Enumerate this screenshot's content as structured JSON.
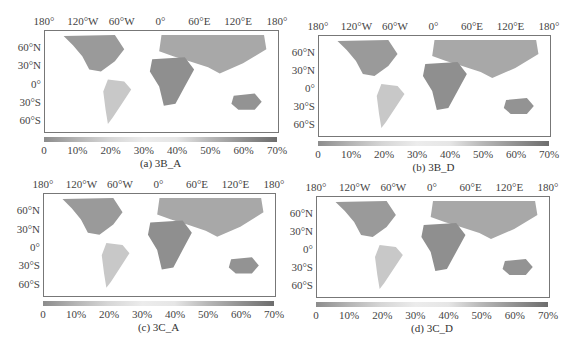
{
  "panels": [
    {
      "id": "a",
      "caption": "(a) 3B_A"
    },
    {
      "id": "b",
      "caption": "(b) 3B_D"
    },
    {
      "id": "c",
      "caption": "(c) 3C_A"
    },
    {
      "id": "d",
      "caption": "(d) 3C_D"
    }
  ],
  "axes": {
    "lon_labels": [
      "180°",
      "120°W",
      "60°W",
      "0°",
      "60°E",
      "120°E",
      "180°"
    ],
    "lat_labels": [
      "60°N",
      "30°N",
      "0°",
      "30°S",
      "60°S"
    ]
  },
  "colorbar": {
    "ticks": [
      "0",
      "10%",
      "20%",
      "30%",
      "40%",
      "50%",
      "60%",
      "70%"
    ]
  },
  "chart_data": [
    {
      "type": "heatmap",
      "title": "(a) 3B_A",
      "xlabel": "Longitude",
      "ylabel": "Latitude",
      "x_ticks": [
        "180°",
        "120°W",
        "60°W",
        "0°",
        "60°E",
        "120°E",
        "180°"
      ],
      "y_ticks": [
        "60°N",
        "30°N",
        "0°",
        "30°S",
        "60°S"
      ],
      "colorbar_range": [
        0,
        70
      ],
      "colorbar_unit": "%",
      "grid": true
    },
    {
      "type": "heatmap",
      "title": "(b) 3B_D",
      "xlabel": "Longitude",
      "ylabel": "Latitude",
      "x_ticks": [
        "180°",
        "120°W",
        "60°W",
        "0°",
        "60°E",
        "120°E",
        "180°"
      ],
      "y_ticks": [
        "60°N",
        "30°N",
        "0°",
        "30°S",
        "60°S"
      ],
      "colorbar_range": [
        0,
        70
      ],
      "colorbar_unit": "%",
      "grid": true
    },
    {
      "type": "heatmap",
      "title": "(c) 3C_A",
      "xlabel": "Longitude",
      "ylabel": "Latitude",
      "x_ticks": [
        "180°",
        "120°W",
        "60°W",
        "0°",
        "60°E",
        "120°E",
        "180°"
      ],
      "y_ticks": [
        "60°N",
        "30°N",
        "0°",
        "30°S",
        "60°S"
      ],
      "colorbar_range": [
        0,
        70
      ],
      "colorbar_unit": "%",
      "grid": true
    },
    {
      "type": "heatmap",
      "title": "(d) 3C_D",
      "xlabel": "Longitude",
      "ylabel": "Latitude",
      "x_ticks": [
        "180°",
        "120°W",
        "60°W",
        "0°",
        "60°E",
        "120°E",
        "180°"
      ],
      "y_ticks": [
        "60°N",
        "30°N",
        "0°",
        "30°S",
        "60°S"
      ],
      "colorbar_range": [
        0,
        70
      ],
      "colorbar_unit": "%",
      "grid": true
    }
  ]
}
